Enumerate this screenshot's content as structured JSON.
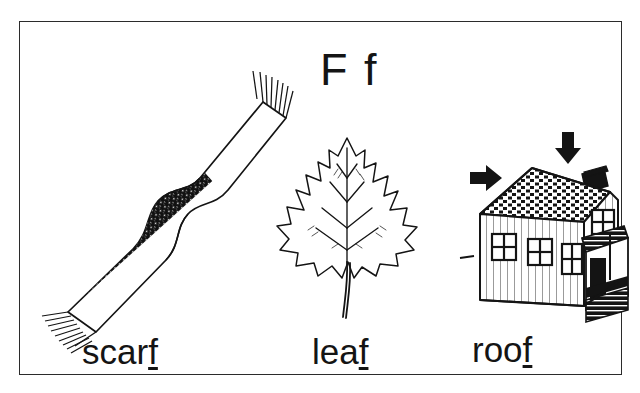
{
  "card": {
    "title_letter": "F f",
    "border_color": "#2b2b2b",
    "ink_color": "#141414",
    "background_color": "#ffffff",
    "theme": "phonics letter Ff final-sound picture card"
  },
  "items": [
    {
      "id": "scarf",
      "word_prefix": "scar",
      "word_highlight": "f",
      "full_word": "scarf",
      "illustration": "striped-scarf-drawing"
    },
    {
      "id": "leaf",
      "word_prefix": "lea",
      "word_highlight": "f",
      "full_word": "leaf",
      "illustration": "lobed-leaf-drawing"
    },
    {
      "id": "roof",
      "word_prefix": "roo",
      "word_highlight": "f",
      "full_word": "roof",
      "illustration": "house-with-roof-arrows-drawing"
    }
  ]
}
